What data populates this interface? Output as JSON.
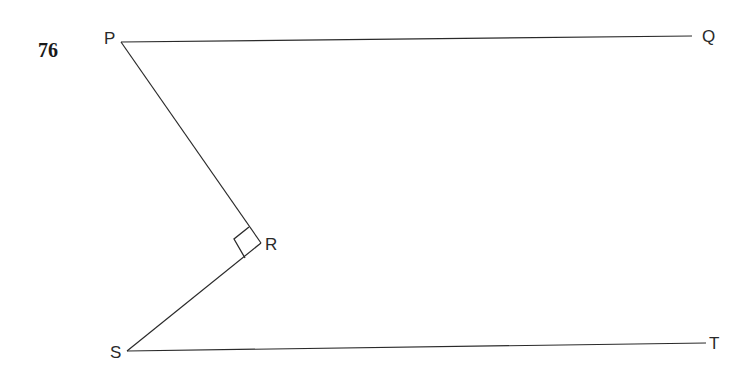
{
  "problem": {
    "number": "76"
  },
  "figure": {
    "points": {
      "P": "P",
      "Q": "Q",
      "R": "R",
      "S": "S",
      "T": "T"
    },
    "segments": [
      "PQ",
      "PR",
      "RS",
      "ST"
    ],
    "right_angle_at": "R",
    "color": "#2a2a2a"
  }
}
